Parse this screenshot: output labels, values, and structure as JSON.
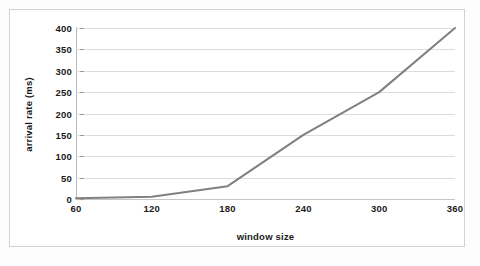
{
  "figure": {
    "background_color": "#ffffff",
    "frame_color": "#d2d2d2",
    "text_color": "#1b1b1b"
  },
  "axis": {
    "y_title": "arrival rate (ms)",
    "x_title": "window size"
  },
  "chart_data": {
    "type": "line",
    "title": "",
    "subtitle": "",
    "xlabel": "window size",
    "ylabel": "arrival rate (ms)",
    "categories": [
      "60",
      "120",
      "180",
      "240",
      "300",
      "360"
    ],
    "x": [
      60,
      120,
      180,
      240,
      300,
      360
    ],
    "values": [
      2,
      5,
      30,
      150,
      250,
      400
    ],
    "series": [
      {
        "name": "arrival rate",
        "values": [
          2,
          5,
          30,
          150,
          250,
          400
        ],
        "color": "#808080",
        "line_width": 2,
        "markers": false
      }
    ],
    "ylim": [
      0,
      400
    ],
    "yticks": [
      0,
      50,
      100,
      150,
      200,
      250,
      300,
      350,
      400
    ],
    "ytick_labels": [
      "0",
      "50",
      "100",
      "150",
      "200",
      "250",
      "300",
      "350",
      "400"
    ],
    "xtick_labels": [
      "60",
      "120",
      "180",
      "240",
      "300",
      "360"
    ],
    "grid": {
      "horizontal": true,
      "vertical": false,
      "color": "#dcdcdc"
    },
    "legend": {
      "visible": false,
      "position": "none",
      "entries": []
    },
    "annotations": []
  }
}
